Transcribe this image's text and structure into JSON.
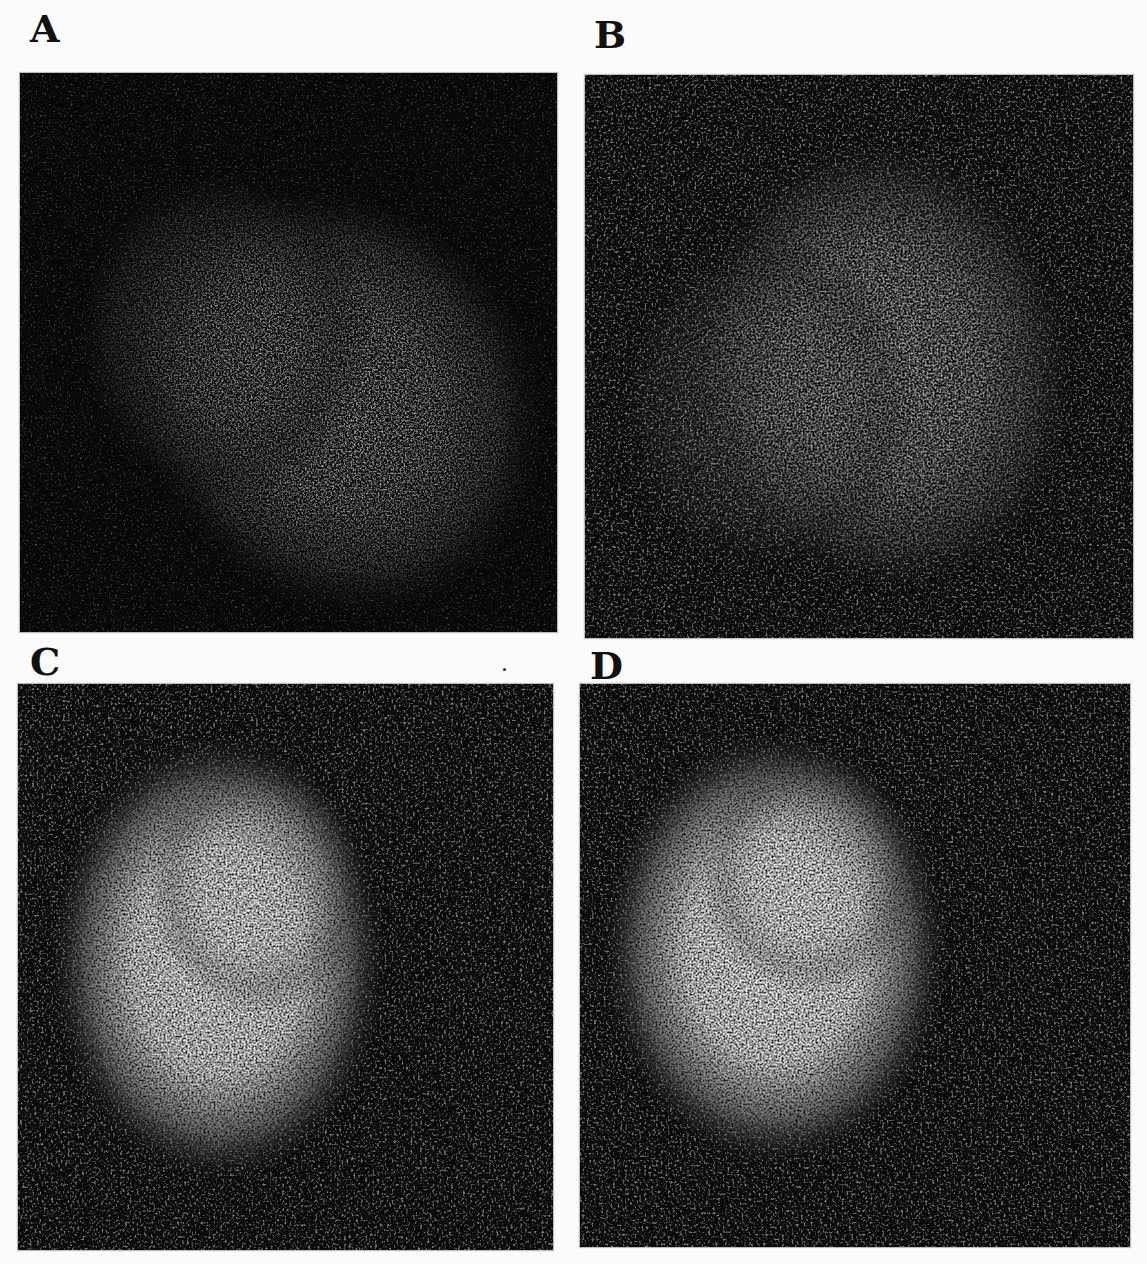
{
  "figure": {
    "background": "#ffffff",
    "panels": [
      {
        "id": "A",
        "label": "A",
        "label_pos": {
          "x": 30,
          "y": 10
        },
        "box": {
          "x": 20,
          "y": 73,
          "w": 537,
          "h": 559
        },
        "hotspot": {
          "cx": 0.62,
          "cy": 0.6,
          "rx": 0.33,
          "ry": 0.36,
          "rotate": -35
        },
        "peak_brightness": 0.72,
        "background_level": 0.1,
        "noise_seed": 3
      },
      {
        "id": "B",
        "label": "B",
        "label_pos": {
          "x": 594,
          "y": 16
        },
        "box": {
          "x": 585,
          "y": 75,
          "w": 548,
          "h": 563
        },
        "hotspot": {
          "cx": 0.55,
          "cy": 0.52,
          "rx": 0.33,
          "ry": 0.4,
          "rotate": -10
        },
        "peak_brightness": 0.7,
        "background_level": 0.22,
        "noise_seed": 7
      },
      {
        "id": "C",
        "label": "C",
        "label_pos": {
          "x": 30,
          "y": 643
        },
        "box": {
          "x": 18,
          "y": 684,
          "w": 535,
          "h": 566
        },
        "hotspot": {
          "cx": 0.37,
          "cy": 0.48,
          "rx": 0.3,
          "ry": 0.38,
          "rotate": 0
        },
        "peak_brightness": 0.95,
        "background_level": 0.2,
        "noise_seed": 11
      },
      {
        "id": "D",
        "label": "D",
        "label_pos": {
          "x": 590,
          "y": 647
        },
        "box": {
          "x": 580,
          "y": 684,
          "w": 550,
          "h": 563
        },
        "hotspot": {
          "cx": 0.35,
          "cy": 0.47,
          "rx": 0.3,
          "ry": 0.37,
          "rotate": 0
        },
        "peak_brightness": 0.97,
        "background_level": 0.22,
        "noise_seed": 19
      }
    ],
    "stray_mark": {
      "x": 503,
      "y": 668
    }
  }
}
